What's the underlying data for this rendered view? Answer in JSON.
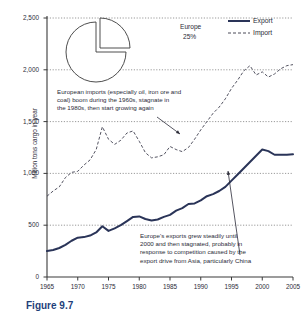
{
  "figure": {
    "caption": "Figure 9.7",
    "ylabel": "Million tons cargo in year"
  },
  "legend": {
    "position": "top-right",
    "entries": [
      {
        "label": "Export",
        "style": "solid",
        "color": "#2a3458"
      },
      {
        "label": "Import",
        "style": "dashed",
        "color": "#4a4a58"
      }
    ]
  },
  "pie": {
    "label": "Europe",
    "value_label": "25%",
    "slice_percent": 25,
    "exploded": true
  },
  "annotations": [
    {
      "name": "import-annotation",
      "lines": [
        "European imports (especially oil, iron ore and",
        "coal) boom during the 1960s, stagnate in",
        "the 1980s, then start growing again"
      ]
    },
    {
      "name": "export-annotation",
      "lines": [
        "Europe's exports grew steadily until",
        "2000 and then stagnated, probably in",
        "response to competition caused by the",
        "export drive from Asia, particularly China"
      ]
    }
  ],
  "chart_data": {
    "type": "line",
    "title": "",
    "xlabel": "",
    "ylabel": "Million tons cargo in year",
    "xlim": [
      1965,
      2005
    ],
    "ylim": [
      0,
      2500
    ],
    "xticks": [
      1965,
      1970,
      1975,
      1980,
      1985,
      1990,
      1995,
      2000,
      2005
    ],
    "yticks": [
      0,
      500,
      1000,
      1500,
      2000,
      2500
    ],
    "ytick_labels": [
      "0",
      "500",
      "1,000",
      "1,500",
      "2,000",
      "2,500"
    ],
    "grid": true,
    "legend_position": "upper right",
    "x": [
      1965,
      1966,
      1967,
      1968,
      1969,
      1970,
      1971,
      1972,
      1973,
      1974,
      1975,
      1976,
      1977,
      1978,
      1979,
      1980,
      1981,
      1982,
      1983,
      1984,
      1985,
      1986,
      1987,
      1988,
      1989,
      1990,
      1991,
      1992,
      1993,
      1994,
      1995,
      1996,
      1997,
      1998,
      1999,
      2000,
      2001,
      2002,
      2003,
      2004,
      2005
    ],
    "series": [
      {
        "name": "Import",
        "style": "dashed",
        "color": "#4a4a58",
        "values": [
          780,
          830,
          870,
          960,
          1010,
          1020,
          1080,
          1130,
          1230,
          1450,
          1330,
          1280,
          1320,
          1390,
          1410,
          1310,
          1200,
          1150,
          1160,
          1180,
          1260,
          1230,
          1210,
          1250,
          1330,
          1420,
          1500,
          1580,
          1640,
          1720,
          1820,
          1900,
          1990,
          2040,
          1950,
          1980,
          1930,
          1960,
          2010,
          2040,
          2050
        ]
      },
      {
        "name": "Export",
        "style": "solid",
        "color": "#2a3458",
        "values": [
          250,
          260,
          280,
          310,
          350,
          380,
          385,
          400,
          430,
          490,
          445,
          470,
          500,
          540,
          580,
          585,
          560,
          545,
          555,
          580,
          600,
          640,
          665,
          705,
          710,
          740,
          780,
          800,
          830,
          870,
          930,
          990,
          1050,
          1110,
          1170,
          1230,
          1215,
          1180,
          1180,
          1180,
          1185
        ]
      }
    ]
  }
}
